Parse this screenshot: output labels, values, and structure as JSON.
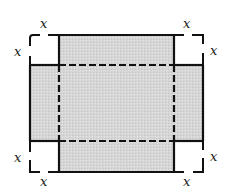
{
  "diagram": {
    "colors": {
      "shaded": "#d4d4d4",
      "line": "#111111",
      "background": "#ffffff"
    },
    "labels": {
      "top_left_top": "x",
      "top_left_side": "x",
      "top_right_top": "x",
      "top_right_side": "x",
      "bottom_left_side": "x",
      "bottom_left_bottom": "x",
      "bottom_right_side": "x",
      "bottom_right_bottom": "x"
    }
  }
}
